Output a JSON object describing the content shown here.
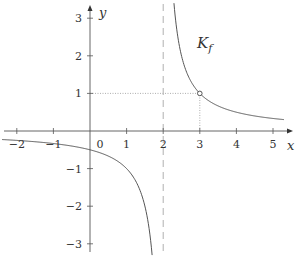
{
  "chart_data": {
    "type": "line",
    "title": "",
    "function": "f(x) = 1/(x-2)",
    "curve_label": "K",
    "curve_label_sub": "f",
    "xlabel": "x",
    "ylabel": "y",
    "xlim": [
      -2.4,
      5.5
    ],
    "ylim": [
      -3.3,
      3.4
    ],
    "x_ticks": [
      -2,
      -1,
      0,
      1,
      2,
      3,
      4,
      5
    ],
    "x_tick_labels": [
      "−2",
      "−1",
      "0",
      "1",
      "2",
      "3",
      "4",
      "5"
    ],
    "y_ticks": [
      -3,
      -2,
      -1,
      1,
      2,
      3
    ],
    "y_tick_labels": [
      "−3",
      "−2",
      "−1",
      "1",
      "2",
      "3"
    ],
    "vertical_asymptote": 2,
    "horizontal_asymptote": 0,
    "marked_point": {
      "x": 3,
      "y": 1,
      "style": "open-circle"
    },
    "guide_lines": [
      {
        "from": [
          0,
          1
        ],
        "to": [
          3,
          1
        ],
        "style": "dotted"
      },
      {
        "from": [
          3,
          0
        ],
        "to": [
          3,
          1
        ],
        "style": "dotted"
      }
    ],
    "series": [
      {
        "name": "K_f left branch",
        "x": [
          -2.4,
          -2,
          -1,
          0,
          1,
          1.5,
          1.7
        ],
        "y": [
          -0.23,
          -0.25,
          -0.33,
          -0.5,
          -1,
          -2,
          -3.3
        ]
      },
      {
        "name": "K_f right branch",
        "x": [
          2.3,
          2.5,
          3,
          4,
          5,
          5.3
        ],
        "y": [
          3.33,
          2,
          1,
          0.5,
          0.33,
          0.3
        ]
      }
    ],
    "grid": false,
    "legend": "none",
    "colors": {
      "axis": "#555555",
      "curve": "#555555",
      "asymptote": "#b0b0b0",
      "guide": "#999999"
    }
  }
}
